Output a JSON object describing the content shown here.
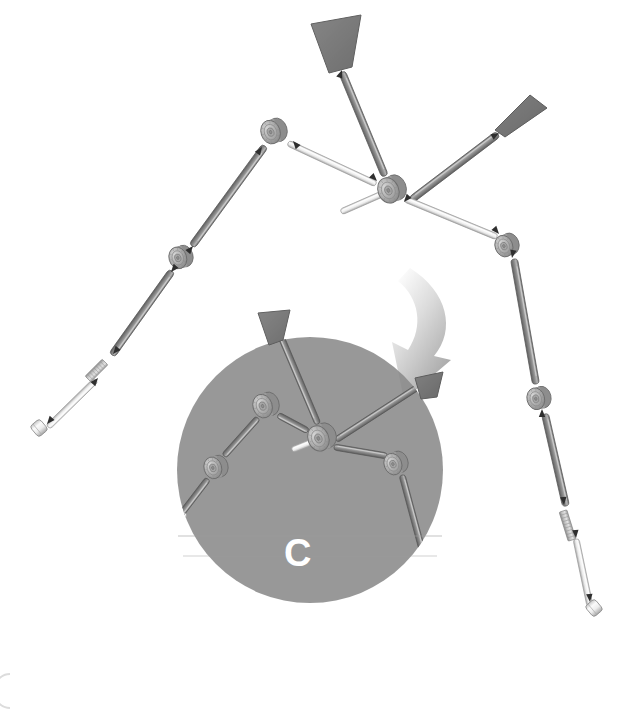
{
  "figure": {
    "background_color": "#ffffff",
    "width": 623,
    "height": 710,
    "detail_callout": {
      "label": "C",
      "label_color": "#ffffff",
      "circle_fill": "#8a8a8a",
      "circle_opacity": 0.88,
      "center_x": 310,
      "center_y": 470,
      "radius": 133
    },
    "zoom_arrow": {
      "name": "curved-zoom-arrow",
      "fill_start": "#ffffff",
      "fill_end": "#9d9d9d",
      "direction": "down-left"
    },
    "corner_mark": {
      "name": "page-corner-arc",
      "color": "#d8d8d8"
    }
  },
  "palette": {
    "rod_dark": "#8d8d8d",
    "rod_dark_edge": "#5f5f5f",
    "rod_light": "#e9e9e9",
    "rod_light_edge": "#9a9a9a",
    "rod_mid": "#bcbcbc",
    "hub_face": "#b5b5b5",
    "hub_rim": "#8f8f8f",
    "hub_edge": "#6e6e6e",
    "paddle_fill": "#7d7d7d",
    "paddle_edge": "#5a5a5a",
    "arrow_marker": "#2f2f2f",
    "thread_fill": "#cfcfcf"
  },
  "parts": {
    "hubs": [
      {
        "name": "hub-center-main",
        "x": 392,
        "y": 189,
        "r": 13,
        "tilt": -22
      },
      {
        "name": "hub-upper-left",
        "x": 274,
        "y": 131,
        "r": 12,
        "tilt": -18
      },
      {
        "name": "hub-mid-left",
        "x": 181,
        "y": 257,
        "r": 11,
        "tilt": -16
      },
      {
        "name": "hub-right-upper",
        "x": 507,
        "y": 245,
        "r": 11,
        "tilt": -20
      },
      {
        "name": "hub-right-lower",
        "x": 539,
        "y": 398,
        "r": 11,
        "tilt": -14
      },
      {
        "name": "hub-detail-center",
        "x": 322,
        "y": 437,
        "r": 13,
        "tilt": -22
      },
      {
        "name": "hub-detail-upleft",
        "x": 266,
        "y": 405,
        "r": 12,
        "tilt": -18
      },
      {
        "name": "hub-detail-left",
        "x": 216,
        "y": 467,
        "r": 11,
        "tilt": -16
      },
      {
        "name": "hub-detail-right",
        "x": 396,
        "y": 463,
        "r": 11,
        "tilt": -20
      },
      {
        "name": "hub-detail-lower",
        "x": 428,
        "y": 570,
        "r": 11,
        "tilt": -14
      }
    ],
    "paddles": [
      {
        "name": "paddle-top",
        "points": "311,24 361,15 352,67 329,73",
        "shade": "#7b7b7b"
      },
      {
        "name": "paddle-upper-right",
        "points": "495,130 530,95 547,108 505,137",
        "shade": "#6f6f6f"
      },
      {
        "name": "paddle-detail-top",
        "points": "258,313 290,310 283,340 269,345",
        "shade": "#7b7b7b"
      },
      {
        "name": "paddle-detail-right",
        "points": "415,378 443,372 437,397 421,399",
        "shade": "#6f6f6f"
      }
    ],
    "rods_dark": [
      {
        "name": "rod-top-flag",
        "x1": 342,
        "y1": 72,
        "x2": 385,
        "y2": 176,
        "w": 7
      },
      {
        "name": "rod-upper-right-flag",
        "x1": 411,
        "y1": 200,
        "x2": 498,
        "y2": 134,
        "w": 7
      },
      {
        "name": "rod-left-upper",
        "x1": 265,
        "y1": 146,
        "x2": 192,
        "y2": 246,
        "w": 7
      },
      {
        "name": "rod-left-lower",
        "x1": 172,
        "y1": 271,
        "x2": 112,
        "y2": 355,
        "w": 7
      },
      {
        "name": "rod-right-down",
        "x1": 514,
        "y1": 259,
        "x2": 536,
        "y2": 384,
        "w": 7
      },
      {
        "name": "rod-right-tail",
        "x1": 545,
        "y1": 414,
        "x2": 566,
        "y2": 506,
        "w": 7
      },
      {
        "name": "rod-detail-center-up",
        "x1": 318,
        "y1": 424,
        "x2": 274,
        "y2": 320,
        "w": 6
      },
      {
        "name": "rod-detail-right-flag",
        "x1": 336,
        "y1": 440,
        "x2": 418,
        "y2": 387,
        "w": 6
      },
      {
        "name": "rod-detail-up-left",
        "x1": 308,
        "y1": 431,
        "x2": 278,
        "y2": 415,
        "w": 6
      },
      {
        "name": "rod-detail-left-1",
        "x1": 258,
        "y1": 418,
        "x2": 224,
        "y2": 456,
        "w": 6
      },
      {
        "name": "rod-detail-left-2",
        "x1": 208,
        "y1": 479,
        "x2": 172,
        "y2": 526,
        "w": 6
      },
      {
        "name": "rod-detail-right-1",
        "x1": 334,
        "y1": 447,
        "x2": 387,
        "y2": 456,
        "w": 6
      },
      {
        "name": "rod-detail-right-2",
        "x1": 402,
        "y1": 475,
        "x2": 424,
        "y2": 557,
        "w": 6
      },
      {
        "name": "rod-detail-lower-1",
        "x1": 433,
        "y1": 583,
        "x2": 443,
        "y2": 629,
        "w": 6
      }
    ],
    "rods_light": [
      {
        "name": "rod-stub-center",
        "x1": 341,
        "y1": 212,
        "x2": 382,
        "y2": 194,
        "w": 6
      },
      {
        "name": "rod-hub-link-upper",
        "x1": 288,
        "y1": 143,
        "x2": 376,
        "y2": 184,
        "w": 6
      },
      {
        "name": "rod-hub-link-right",
        "x1": 405,
        "y1": 199,
        "x2": 497,
        "y2": 237,
        "w": 6
      },
      {
        "name": "rod-left-tip",
        "x1": 96,
        "y1": 380,
        "x2": 48,
        "y2": 427,
        "w": 6
      },
      {
        "name": "rod-right-tip",
        "x1": 576,
        "y1": 539,
        "x2": 590,
        "y2": 606,
        "w": 6
      },
      {
        "name": "rod-detail-stub",
        "x1": 292,
        "y1": 450,
        "x2": 327,
        "y2": 436,
        "w": 6
      },
      {
        "name": "rod-detail-left-tip",
        "x1": 185,
        "y1": 513,
        "x2": 163,
        "y2": 552,
        "w": 6
      },
      {
        "name": "rod-detail-lower-tip",
        "x1": 437,
        "y1": 620,
        "x2": 447,
        "y2": 675,
        "w": 6
      }
    ],
    "threaded_segments": [
      {
        "name": "thread-left-branch",
        "x1": 105,
        "y1": 362,
        "x2": 88,
        "y2": 379,
        "w": 8
      },
      {
        "name": "thread-right-branch",
        "x1": 563,
        "y1": 511,
        "x2": 572,
        "y2": 540,
        "w": 8
      },
      {
        "name": "thread-detail-left",
        "x1": 178,
        "y1": 512,
        "x2": 168,
        "y2": 524,
        "w": 7
      },
      {
        "name": "thread-detail-lower",
        "x1": 432,
        "y1": 617,
        "x2": 437,
        "y2": 634,
        "w": 7
      }
    ],
    "end_caps": [
      {
        "name": "end-cap-left",
        "x": 39,
        "y": 428,
        "r": 7
      },
      {
        "name": "end-cap-right",
        "x": 594,
        "y": 608,
        "r": 7
      },
      {
        "name": "end-cap-detail-left",
        "x": 160,
        "y": 556,
        "r": 6
      },
      {
        "name": "end-cap-detail-lower",
        "x": 447,
        "y": 678,
        "r": 6
      }
    ],
    "assembly_arrows": [
      {
        "name": "assembly-arrow-1",
        "x": 293,
        "y": 141,
        "angle": 230
      },
      {
        "name": "assembly-arrow-2",
        "x": 262,
        "y": 147,
        "angle": 305
      },
      {
        "name": "assembly-arrow-3",
        "x": 377,
        "y": 181,
        "angle": 45
      },
      {
        "name": "assembly-arrow-4",
        "x": 404,
        "y": 202,
        "angle": 130
      },
      {
        "name": "assembly-arrow-5",
        "x": 499,
        "y": 234,
        "angle": 50
      },
      {
        "name": "assembly-arrow-6",
        "x": 512,
        "y": 258,
        "angle": 100
      },
      {
        "name": "assembly-arrow-7",
        "x": 193,
        "y": 246,
        "angle": 310
      },
      {
        "name": "assembly-arrow-8",
        "x": 171,
        "y": 272,
        "angle": 130
      },
      {
        "name": "assembly-arrow-9",
        "x": 113,
        "y": 354,
        "angle": 130
      },
      {
        "name": "assembly-arrow-10",
        "x": 98,
        "y": 378,
        "angle": 310
      },
      {
        "name": "assembly-arrow-11",
        "x": 47,
        "y": 424,
        "angle": 130
      },
      {
        "name": "assembly-arrow-12",
        "x": 542,
        "y": 409,
        "angle": 270
      },
      {
        "name": "assembly-arrow-13",
        "x": 564,
        "y": 505,
        "angle": 85
      },
      {
        "name": "assembly-arrow-14",
        "x": 576,
        "y": 538,
        "angle": 85
      },
      {
        "name": "assembly-arrow-15",
        "x": 590,
        "y": 602,
        "angle": 85
      },
      {
        "name": "assembly-arrow-16",
        "x": 342,
        "y": 70,
        "angle": 290
      },
      {
        "name": "assembly-arrow-17",
        "x": 499,
        "y": 133,
        "angle": 330
      }
    ]
  }
}
